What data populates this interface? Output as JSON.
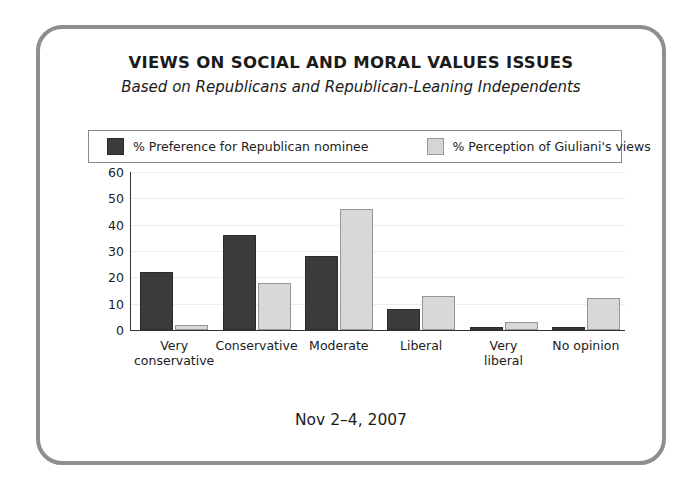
{
  "frame": {
    "border_color": "#8e8e8e"
  },
  "chart_data": {
    "type": "bar",
    "title": "VIEWS ON SOCIAL AND MORAL VALUES ISSUES",
    "subtitle": "Based on Republicans and Republican-Leaning Independents",
    "xlabel": "",
    "ylabel": "",
    "ylim": [
      0,
      60
    ],
    "yticks": [
      60,
      50,
      40,
      30,
      20,
      10,
      0
    ],
    "grid": true,
    "legend_position": "top",
    "categories": [
      "Very\nconservative",
      "Conservative",
      "Moderate",
      "Liberal",
      "Very\nliberal",
      "No opinion"
    ],
    "category_labels": [
      {
        "line1": "Very",
        "line2": "conservative"
      },
      {
        "line1": "Conservative",
        "line2": ""
      },
      {
        "line1": "Moderate",
        "line2": ""
      },
      {
        "line1": "Liberal",
        "line2": ""
      },
      {
        "line1": "Very",
        "line2": "liberal"
      },
      {
        "line1": "No opinion",
        "line2": ""
      }
    ],
    "series": [
      {
        "name": "% Preference for Republican nominee",
        "color": "#3b3b3b",
        "values": [
          22,
          36,
          28,
          8,
          1,
          1
        ]
      },
      {
        "name": "% Perception of Giuliani's views",
        "color": "#d8d8d8",
        "values": [
          2,
          18,
          46,
          13,
          3,
          12
        ]
      }
    ]
  },
  "legend": {
    "items": [
      {
        "label": "% Preference for Republican nominee",
        "swatch": "dark"
      },
      {
        "label": "% Perception of Giuliani's views",
        "swatch": "light"
      }
    ]
  },
  "footer": {
    "date": "Nov 2–4, 2007"
  }
}
